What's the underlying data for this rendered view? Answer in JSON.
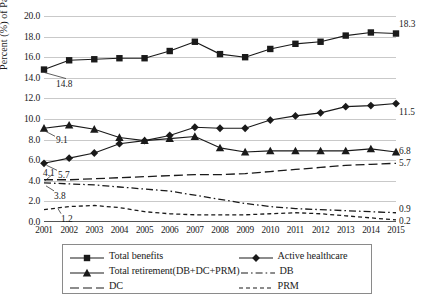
{
  "chart_data": {
    "type": "line",
    "title": "",
    "xlabel": "",
    "ylabel": "Percent (%) of Pay",
    "ylim": [
      0.0,
      20.0
    ],
    "ytick_step": 2.0,
    "grid": true,
    "legend_position": "bottom",
    "categories": [
      "2001",
      "2002",
      "2003",
      "2004",
      "2005",
      "2006",
      "2007",
      "2008",
      "2009",
      "2010",
      "2011",
      "2012",
      "2013",
      "2014",
      "2015"
    ],
    "yticks": [
      "0.0",
      "2.0",
      "4.0",
      "6.0",
      "8.0",
      "10.0",
      "12.0",
      "14.0",
      "16.0",
      "18.0",
      "20.0"
    ],
    "series": [
      {
        "name": "Total benefits",
        "marker": "square",
        "style": "solid",
        "values": [
          14.8,
          15.7,
          15.8,
          15.9,
          15.9,
          16.6,
          17.5,
          16.3,
          16.0,
          16.8,
          17.3,
          17.5,
          18.1,
          18.4,
          18.3
        ],
        "start_label": "14.8",
        "end_label": "18.3"
      },
      {
        "name": "Active healthcare",
        "marker": "diamond",
        "style": "solid",
        "values": [
          5.7,
          6.2,
          6.7,
          7.6,
          7.9,
          8.4,
          9.2,
          9.1,
          9.1,
          9.9,
          10.3,
          10.6,
          11.2,
          11.3,
          11.5
        ],
        "start_label": "5.7",
        "end_label": "11.5"
      },
      {
        "name": "Total retirement(DB+DC+PRM)",
        "marker": "triangle",
        "style": "solid",
        "values": [
          9.1,
          9.4,
          9.0,
          8.2,
          7.9,
          8.1,
          8.3,
          7.2,
          6.8,
          6.9,
          6.9,
          6.9,
          6.9,
          7.1,
          6.8
        ],
        "start_label": "9.1",
        "end_label": "6.8"
      },
      {
        "name": "DB",
        "marker": "none",
        "style": "dash-dot",
        "values": [
          3.8,
          3.7,
          3.6,
          3.4,
          3.2,
          3.0,
          2.6,
          2.2,
          1.8,
          1.5,
          1.3,
          1.2,
          1.1,
          1.0,
          0.9
        ],
        "start_label": "3.8",
        "end_label": "0.9"
      },
      {
        "name": "DC",
        "marker": "none",
        "style": "long-dash",
        "values": [
          4.1,
          4.1,
          4.2,
          4.3,
          4.4,
          4.5,
          4.6,
          4.6,
          4.7,
          4.9,
          5.1,
          5.3,
          5.5,
          5.6,
          5.7
        ],
        "start_label": "4.1",
        "end_label": "5.7"
      },
      {
        "name": "PRM",
        "marker": "none",
        "style": "short-dash",
        "values": [
          1.2,
          1.5,
          1.6,
          1.4,
          1.0,
          0.8,
          0.7,
          0.7,
          0.7,
          0.8,
          0.9,
          0.8,
          0.6,
          0.4,
          0.2
        ],
        "start_label": "1.2",
        "end_label": "0.2"
      }
    ],
    "annotations": [
      {
        "text": "14.8",
        "series": "Total benefits",
        "at": "2001"
      },
      {
        "text": "18.3",
        "series": "Total benefits",
        "at": "2015"
      },
      {
        "text": "9.1",
        "series": "Total retirement(DB+DC+PRM)",
        "at": "2001"
      },
      {
        "text": "6.8",
        "series": "Total retirement(DB+DC+PRM)",
        "at": "2015"
      },
      {
        "text": "5.7",
        "series": "Active healthcare",
        "at": "2001"
      },
      {
        "text": "11.5",
        "series": "Active healthcare",
        "at": "2015"
      },
      {
        "text": "4.1",
        "series": "DC",
        "at": "2001"
      },
      {
        "text": "5.7",
        "series": "DC",
        "at": "2015"
      },
      {
        "text": "3.8",
        "series": "DB",
        "at": "2001"
      },
      {
        "text": "0.9",
        "series": "DB",
        "at": "2015"
      },
      {
        "text": "1.2",
        "series": "PRM",
        "at": "2001"
      },
      {
        "text": "0.2",
        "series": "PRM",
        "at": "2015"
      }
    ]
  },
  "legend": {
    "entries": [
      {
        "label": "Total benefits",
        "marker": "square",
        "style": "solid"
      },
      {
        "label": "Active healthcare",
        "marker": "diamond",
        "style": "solid"
      },
      {
        "label": "Total retirement(DB+DC+PRM)",
        "marker": "triangle",
        "style": "solid"
      },
      {
        "label": "DB",
        "marker": "none",
        "style": "dash-dot"
      },
      {
        "label": "DC",
        "marker": "none",
        "style": "long-dash"
      },
      {
        "label": "PRM",
        "marker": "none",
        "style": "short-dash"
      }
    ]
  },
  "colors": {
    "ink": "#1a1a1a",
    "grid": "#c9c9c9",
    "axis": "#555555",
    "background": "#ffffff"
  }
}
